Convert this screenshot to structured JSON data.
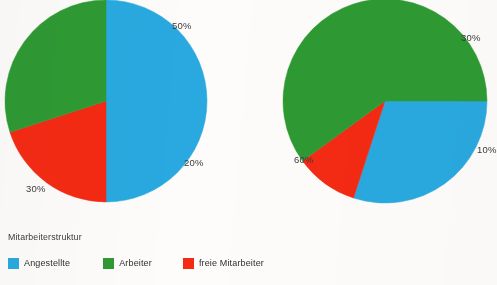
{
  "background_color": "#fdfcfa",
  "legend": {
    "title": "Mitarbeiterstruktur",
    "items": [
      {
        "label": "Angestellte",
        "color": "#29a9e0",
        "key": "angestellte"
      },
      {
        "label": "Arbeiter",
        "color": "#2e9a33",
        "key": "arbeiter"
      },
      {
        "label": "freie  Mitarbeiter",
        "color": "#f42a14",
        "key": "freie-mitarbeiter"
      }
    ]
  },
  "charts": [
    {
      "name": "pie-left",
      "center_x": 106,
      "center_y": 101,
      "radius": 101,
      "labels": [
        {
          "text": "50%",
          "x": 172,
          "y": 20
        },
        {
          "text": "20%",
          "x": 184,
          "y": 157
        },
        {
          "text": "30%",
          "x": 26,
          "y": 183
        }
      ]
    },
    {
      "name": "pie-right",
      "center_x": 385,
      "center_y": 101,
      "radius": 102,
      "labels": [
        {
          "text": "30%",
          "x": 461,
          "y": 32
        },
        {
          "text": "10%",
          "x": 477,
          "y": 144
        },
        {
          "text": "60%",
          "x": 294,
          "y": 154
        }
      ]
    }
  ],
  "chart_data": [
    {
      "type": "pie",
      "title": "Mitarbeiterstruktur",
      "name": "pie-left",
      "categories": [
        "Angestellte",
        "Arbeiter",
        "freie Mitarbeiter"
      ],
      "values": [
        50,
        30,
        20
      ],
      "value_labels": [
        "50%",
        "30%",
        "20%"
      ],
      "colors": [
        "#29a9e0",
        "#2e9a33",
        "#f42a14"
      ],
      "units": "percent",
      "start_angle_deg": 270,
      "direction": "clockwise",
      "slice_order": [
        "Angestellte",
        "freie Mitarbeiter",
        "Arbeiter"
      ],
      "legend_position": "bottom",
      "grid": false
    },
    {
      "type": "pie",
      "title": "Mitarbeiterstruktur",
      "name": "pie-right",
      "categories": [
        "Angestellte",
        "Arbeiter",
        "freie Mitarbeiter"
      ],
      "values": [
        30,
        60,
        10
      ],
      "value_labels": [
        "30%",
        "60%",
        "10%"
      ],
      "colors": [
        "#29a9e0",
        "#2e9a33",
        "#f42a14"
      ],
      "units": "percent",
      "start_angle_deg": 0,
      "direction": "clockwise",
      "slice_order": [
        "Angestellte",
        "freie Mitarbeiter",
        "Arbeiter"
      ],
      "legend_position": "bottom",
      "grid": false
    }
  ]
}
